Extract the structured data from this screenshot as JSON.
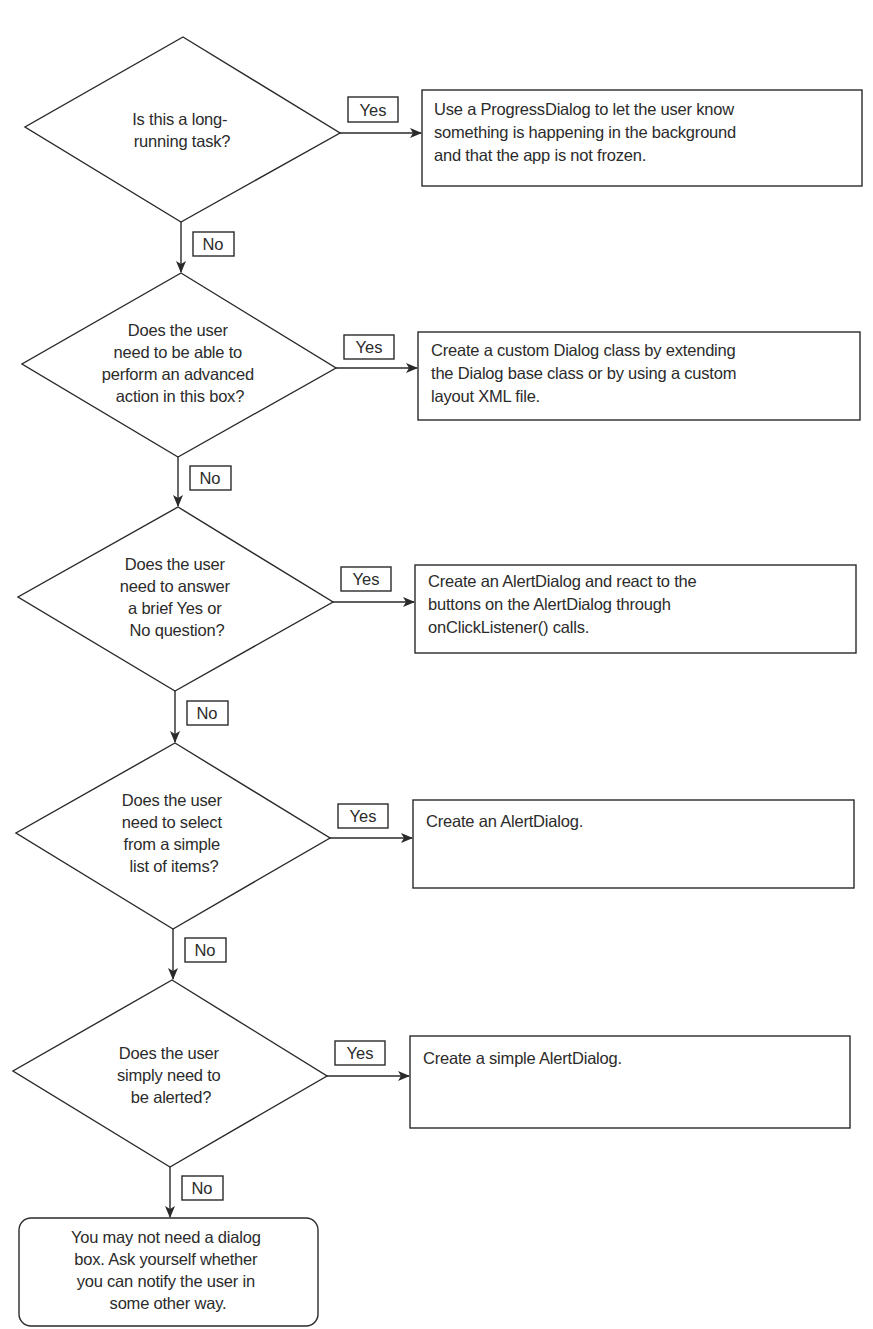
{
  "flowchart": {
    "decisions": [
      {
        "id": "d1",
        "lines": [
          "Is this a long-",
          "running task?"
        ],
        "yes_label": "Yes",
        "no_label": "No",
        "yes_action": [
          "Use a ProgressDialog to let the user know",
          "something is happening in the background",
          "and that the app is not frozen."
        ]
      },
      {
        "id": "d2",
        "lines": [
          "Does the user",
          "need to be able to",
          "perform an advanced",
          "action in this box?"
        ],
        "yes_label": "Yes",
        "no_label": "No",
        "yes_action": [
          "Create a custom Dialog class by extending",
          "the Dialog base class or by using a custom",
          "layout XML file."
        ]
      },
      {
        "id": "d3",
        "lines": [
          "Does the user",
          "need to answer",
          "a brief Yes or",
          "No question?"
        ],
        "yes_label": "Yes",
        "no_label": "No",
        "yes_action": [
          "Create an AlertDialog and react to the",
          "buttons on the AlertDialog through",
          "onClickListener() calls."
        ]
      },
      {
        "id": "d4",
        "lines": [
          "Does the user",
          "need to select",
          "from a simple",
          "list of items?"
        ],
        "yes_label": "Yes",
        "no_label": "No",
        "yes_action": [
          "Create an AlertDialog."
        ]
      },
      {
        "id": "d5",
        "lines": [
          "Does the user",
          "simply need to",
          "be alerted?"
        ],
        "yes_label": "Yes",
        "no_label": "No",
        "yes_action": [
          "Create a simple AlertDialog."
        ]
      }
    ],
    "terminal": {
      "lines": [
        "You may not need a dialog",
        "box. Ask yourself whether",
        "you can notify the user in",
        "some other way."
      ]
    },
    "colors": {
      "stroke": "#2a2a2a",
      "text": "#2b2b2b",
      "background": "#ffffff"
    }
  }
}
